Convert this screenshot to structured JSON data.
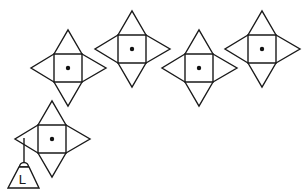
{
  "diagram": {
    "colors": {
      "line": "#1a1a1a",
      "background": "#ffffff"
    },
    "nets": [
      {
        "id": "net-1",
        "cx": 68,
        "cy": 68,
        "half": 14,
        "flap": 38,
        "has_dot": true
      },
      {
        "id": "net-2",
        "cx": 132,
        "cy": 49,
        "half": 14,
        "flap": 38,
        "has_dot": true
      },
      {
        "id": "net-3",
        "cx": 199,
        "cy": 68,
        "half": 14,
        "flap": 38,
        "has_dot": true
      },
      {
        "id": "net-4",
        "cx": 262,
        "cy": 49,
        "half": 14,
        "flap": 38,
        "has_dot": true
      },
      {
        "id": "net-5",
        "cx": 52,
        "cy": 139,
        "half": 14,
        "flap": 38,
        "has_dot": true
      }
    ],
    "weight": {
      "label": "L",
      "attached_to": "net-5",
      "string_x": 24,
      "string_top": 138,
      "string_bottom": 162
    }
  }
}
